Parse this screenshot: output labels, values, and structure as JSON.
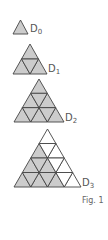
{
  "figure": {
    "caption": "Fig. 1",
    "colors": {
      "fill": "#cccccc",
      "stroke": "#444444",
      "empty": "#ffffff"
    },
    "diagrams": [
      {
        "name": "D",
        "index": "0",
        "rows": 1,
        "apex": [
          20.5,
          20
        ],
        "base_y": 34,
        "half_width": 7.5,
        "label_pos": [
          30,
          24
        ]
      },
      {
        "name": "D",
        "index": "1",
        "rows": 2,
        "apex": [
          30,
          44
        ],
        "base_y": 74,
        "half_width": 17,
        "label_pos": [
          48,
          64
        ]
      },
      {
        "name": "D",
        "index": "2",
        "rows": 3,
        "apex": [
          39,
          79
        ],
        "base_y": 122,
        "half_width": 25,
        "label_pos": [
          65,
          113
        ]
      },
      {
        "name": "D",
        "index": "3",
        "rows": 4,
        "apex": [
          47.5,
          129
        ],
        "base_y": 187,
        "half_width": 33.5,
        "label_pos": [
          82,
          178
        ],
        "shaded_subtriangle_rows": 3
      }
    ]
  }
}
